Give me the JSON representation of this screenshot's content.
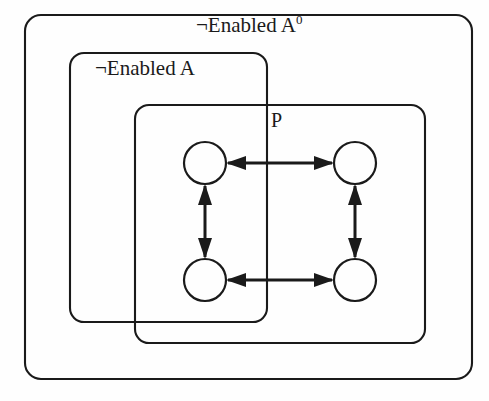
{
  "diagram": {
    "background_color": "#fefefe",
    "stroke_color": "#1a1a1a",
    "regions": [
      {
        "id": "outer",
        "label_prefix": "¬Enabled A",
        "label_superscript": "0",
        "label_full": "¬Enabled A⁰",
        "shape": "rounded-rectangle",
        "x": 25,
        "y": 15,
        "width": 447,
        "height": 364,
        "radius": 16
      },
      {
        "id": "middle",
        "label_prefix": "¬Enabled A",
        "label_superscript": "",
        "label_full": "¬Enabled A",
        "shape": "rounded-rectangle",
        "x": 70,
        "y": 53,
        "width": 197,
        "height": 269,
        "radius": 14
      },
      {
        "id": "inner",
        "label_prefix": "P",
        "label_superscript": "",
        "label_full": "P",
        "shape": "rounded-rectangle",
        "x": 135,
        "y": 105,
        "width": 290,
        "height": 238,
        "radius": 14
      }
    ],
    "nodes": [
      {
        "id": "top-left",
        "cx": 205,
        "cy": 163,
        "r": 21,
        "label": ""
      },
      {
        "id": "top-right",
        "cx": 355,
        "cy": 163,
        "r": 21,
        "label": ""
      },
      {
        "id": "bottom-left",
        "cx": 205,
        "cy": 280,
        "r": 21,
        "label": ""
      },
      {
        "id": "bottom-right",
        "cx": 355,
        "cy": 280,
        "r": 21,
        "label": ""
      }
    ],
    "edges": [
      {
        "id": "edge-top-horizontal",
        "from": "top-left",
        "to": "top-right",
        "direction": "bidirectional",
        "orientation": "horizontal"
      },
      {
        "id": "edge-bottom-horizontal",
        "from": "bottom-left",
        "to": "bottom-right",
        "direction": "bidirectional",
        "orientation": "horizontal"
      },
      {
        "id": "edge-left-vertical",
        "from": "top-left",
        "to": "bottom-left",
        "direction": "bidirectional",
        "orientation": "vertical"
      },
      {
        "id": "edge-right-vertical",
        "from": "top-right",
        "to": "bottom-right",
        "direction": "bidirectional",
        "orientation": "vertical"
      }
    ]
  }
}
